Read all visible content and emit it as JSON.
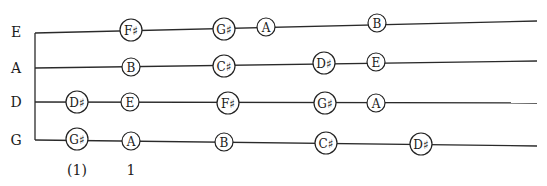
{
  "diagram": {
    "type": "string-fingering-chart",
    "nut": {
      "x": 35,
      "y_top": 33,
      "y_bottom": 140
    },
    "strings": [
      {
        "name": "E",
        "label_x": 16,
        "label_y": 32,
        "x1": 35,
        "y1": 33,
        "x2": 537,
        "y2": 21
      },
      {
        "name": "A",
        "label_x": 16,
        "label_y": 68,
        "x1": 35,
        "y1": 68,
        "x2": 537,
        "y2": 61
      },
      {
        "name": "D",
        "label_x": 16,
        "label_y": 102,
        "x1": 35,
        "y1": 102,
        "x2": 537,
        "y2": 103
      },
      {
        "name": "G",
        "label_x": 16,
        "label_y": 140,
        "x1": 35,
        "y1": 140,
        "x2": 537,
        "y2": 146
      }
    ],
    "notes": [
      {
        "string": "E",
        "label": "F♯",
        "x": 131,
        "y": 30,
        "r": 11
      },
      {
        "string": "E",
        "label": "G♯",
        "x": 224,
        "y": 29,
        "r": 11
      },
      {
        "string": "E",
        "label": "A",
        "x": 266,
        "y": 27,
        "r": 9
      },
      {
        "string": "E",
        "label": "B",
        "x": 377,
        "y": 23,
        "r": 9
      },
      {
        "string": "A",
        "label": "B",
        "x": 131,
        "y": 67,
        "r": 9
      },
      {
        "string": "A",
        "label": "C♯",
        "x": 224,
        "y": 66,
        "r": 11
      },
      {
        "string": "A",
        "label": "D♯",
        "x": 324,
        "y": 63,
        "r": 11
      },
      {
        "string": "A",
        "label": "E",
        "x": 376,
        "y": 62,
        "r": 9
      },
      {
        "string": "D",
        "label": "D♯",
        "x": 77,
        "y": 102,
        "r": 11
      },
      {
        "string": "D",
        "label": "E",
        "x": 130,
        "y": 102,
        "r": 9
      },
      {
        "string": "D",
        "label": "F♯",
        "x": 228,
        "y": 103,
        "r": 11
      },
      {
        "string": "D",
        "label": "G♯",
        "x": 325,
        "y": 103,
        "r": 11
      },
      {
        "string": "D",
        "label": "A",
        "x": 376,
        "y": 103,
        "r": 9
      },
      {
        "string": "G",
        "label": "G♯",
        "x": 77,
        "y": 139,
        "r": 11
      },
      {
        "string": "G",
        "label": "A",
        "x": 131,
        "y": 141,
        "r": 9
      },
      {
        "string": "G",
        "label": "B",
        "x": 224,
        "y": 142,
        "r": 9
      },
      {
        "string": "G",
        "label": "C♯",
        "x": 326,
        "y": 143,
        "r": 11
      },
      {
        "string": "G",
        "label": "D♯",
        "x": 421,
        "y": 144,
        "r": 11
      }
    ],
    "finger_labels": [
      {
        "text": "(1)",
        "x": 77,
        "y": 170
      },
      {
        "text": "1",
        "x": 131,
        "y": 170
      }
    ]
  }
}
